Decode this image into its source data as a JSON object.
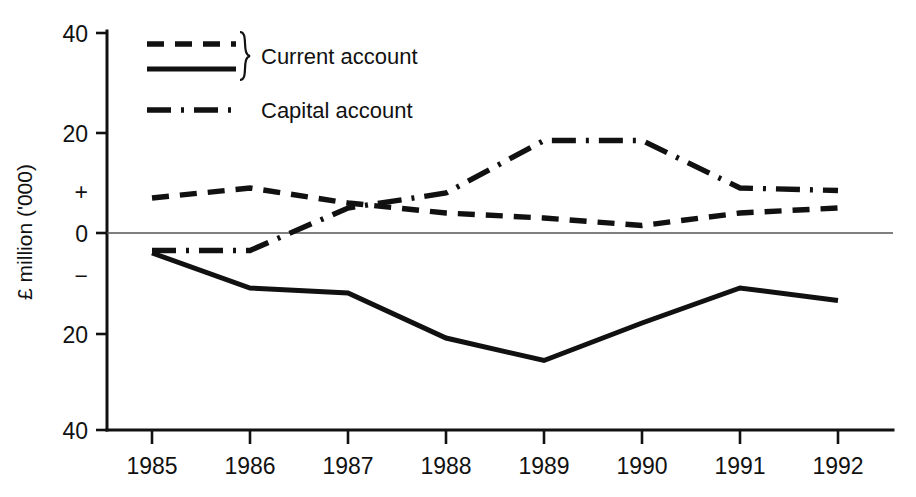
{
  "chart_data": {
    "type": "line",
    "title": "",
    "subtitle": "",
    "xlabel": "",
    "ylabel": "£ million ('000)",
    "x": [
      1985,
      1986,
      1987,
      1988,
      1989,
      1990,
      1991,
      1992
    ],
    "categories": [
      "1985",
      "1986",
      "1987",
      "1988",
      "1989",
      "1990",
      "1991",
      "1992"
    ],
    "xtick_labels": [
      "1985",
      "1986",
      "1987",
      "1988",
      "1989",
      "1990",
      "1991",
      "1992"
    ],
    "ytick_labels": [
      "40",
      "20",
      "+",
      "0",
      "−",
      "20",
      "40"
    ],
    "ytick_values": [
      40,
      20,
      null,
      0,
      null,
      -20,
      -40
    ],
    "ylim": [
      -40,
      40
    ],
    "xlim": [
      1985,
      1992
    ],
    "grid": false,
    "zero_line": true,
    "legend_position": "top-left",
    "series": [
      {
        "name": "Current account",
        "style": "dashed",
        "legend_group": "Current account",
        "values": [
          7,
          9,
          6,
          4,
          3,
          1.5,
          4,
          5
        ]
      },
      {
        "name": "Current account",
        "style": "solid",
        "legend_group": "Current account",
        "values": [
          -4,
          -11,
          -12,
          -21,
          -25.5,
          -18,
          -11,
          -13.5
        ]
      },
      {
        "name": "Capital account",
        "style": "dash-dot",
        "legend_group": "Capital account",
        "values": [
          -3.5,
          -3.5,
          5,
          8,
          18.5,
          18.5,
          9,
          8.5
        ]
      }
    ],
    "colors": {
      "series_line": "#111111",
      "axis": "#111111",
      "zero_line": "#555555",
      "background": "#ffffff"
    }
  },
  "legend": {
    "entries": [
      {
        "label": "Current account",
        "styles": [
          "dashed",
          "solid"
        ],
        "braced": true
      },
      {
        "label": "Capital account",
        "styles": [
          "dash-dot"
        ],
        "braced": false
      }
    ]
  },
  "axis": {
    "y_title": "£ million ('000)",
    "y_ticks": [
      "40",
      "20",
      "+",
      "0",
      "−",
      "20",
      "40"
    ],
    "x_ticks": [
      "1985",
      "1986",
      "1987",
      "1988",
      "1989",
      "1990",
      "1991",
      "1992"
    ]
  }
}
